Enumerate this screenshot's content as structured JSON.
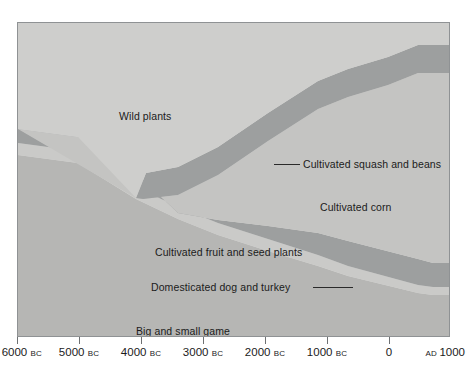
{
  "figure": {
    "background_color": "#ffffff",
    "plot_background_color": "#d9d9d7",
    "frame_color": "#8f9294"
  },
  "chart_data": {
    "type": "area",
    "title": "",
    "subtitle": "",
    "xlabel": "",
    "ylabel": "",
    "xlim": [
      -6000,
      1000
    ],
    "grid": false,
    "legend_position": "none",
    "x_axis": {
      "ticks": [
        {
          "value": -6000,
          "label": "6000",
          "era": "BC",
          "x_px": 17
        },
        {
          "value": -5000,
          "label": "5000",
          "era": "BC",
          "x_px": 79
        },
        {
          "value": -4000,
          "label": "4000",
          "era": "BC",
          "x_px": 141
        },
        {
          "value": -3000,
          "label": "3000",
          "era": "BC",
          "x_px": 203
        },
        {
          "value": -2000,
          "label": "2000",
          "era": "BC",
          "x_px": 265
        },
        {
          "value": -1000,
          "label": "1000",
          "era": "BC",
          "x_px": 327
        },
        {
          "value": 0,
          "label": "0",
          "era": "",
          "x_px": 389
        },
        {
          "value": 1000,
          "label": "1000",
          "era": "AD",
          "era_position": "before",
          "x_px": 450
        }
      ]
    },
    "bands": [
      {
        "name": "Wild plants",
        "color": "#cdcdcb",
        "region": "top",
        "label_x_px": 101,
        "label_y_px": 88
      },
      {
        "name": "Cultivated squash and beans",
        "color": "#9a9c9c",
        "region": "upper-band",
        "leader_line": true,
        "label_x_px": 285,
        "label_y_px": 136
      },
      {
        "name": "Cultivated corn",
        "color": "#c3c3c1",
        "region": "middle",
        "label_x_px": 302,
        "label_y_px": 179
      },
      {
        "name": "Cultivated fruit and seed plants",
        "color": "#9a9c9c",
        "region": "lower-band",
        "label_x_px": 137,
        "label_y_px": 224
      },
      {
        "name": "Domesticated dog and turkey",
        "color": "#c9c9c7",
        "region": "lower-thin-band",
        "leader_line": true,
        "label_x_px": 133,
        "label_y_px": 259
      },
      {
        "name": "Big and small game",
        "color": "#b4b4b2",
        "region": "bottom",
        "label_x_px": 118,
        "label_y_px": 303
      }
    ]
  },
  "labels": {
    "wild_plants": "Wild plants",
    "cultivated_squash_and_beans": "Cultivated squash and beans",
    "cultivated_corn": "Cultivated corn",
    "cultivated_fruit_and_seed_plants": "Cultivated fruit and seed plants",
    "domesticated_dog_and_turkey": "Domesticated dog and turkey",
    "big_and_small_game": "Big and small game"
  }
}
